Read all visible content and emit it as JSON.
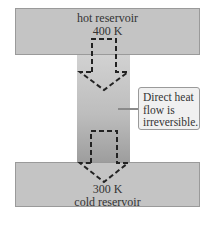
{
  "diagram": {
    "hot_reservoir": {
      "label": "hot reservoir",
      "temperature": "400 K"
    },
    "cold_reservoir": {
      "temperature": "300 K",
      "label": "cold reservoir"
    },
    "callout": {
      "text": "Direct heat flow is irreversible."
    },
    "arrows": [
      {
        "name": "heat-flow-arrow-top",
        "direction": "down",
        "style": "dashed"
      },
      {
        "name": "heat-flow-arrow-bottom",
        "direction": "down",
        "style": "dashed"
      }
    ],
    "colors": {
      "reservoir": "#c4c4c4",
      "column_top": "#d2d2d2",
      "column_bottom": "#9c9c9c",
      "callout_bg": "#f0f0f0"
    }
  }
}
